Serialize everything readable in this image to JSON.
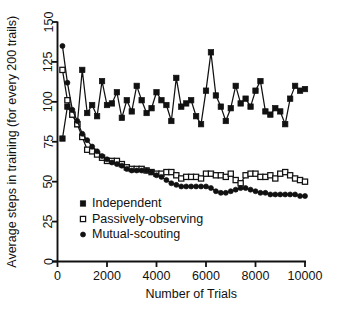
{
  "chart_data": {
    "type": "line",
    "title": "",
    "subtitle": "",
    "xlabel": "Number of Trials",
    "ylabel": "Average steps in training (for every 200 trails)",
    "xlim": [
      0,
      10000
    ],
    "ylim": [
      0,
      150
    ],
    "xticks": [
      0,
      2000,
      4000,
      6000,
      8000,
      10000
    ],
    "xtick_labels": [
      "0",
      "2000",
      "4000",
      "6000",
      "8000",
      "10000"
    ],
    "yticks": [
      0,
      25,
      50,
      75,
      100,
      125,
      150
    ],
    "ytick_labels": [
      "0",
      "25",
      "50",
      "75",
      "100",
      "125",
      "150"
    ],
    "grid": false,
    "legend_position": "inside-lower-left",
    "marker_colors": {
      "line": "#111111",
      "fill": "#111111",
      "open_fill": "#ffffff"
    },
    "x": [
      200,
      400,
      600,
      800,
      1000,
      1200,
      1400,
      1600,
      1800,
      2000,
      2200,
      2400,
      2600,
      2800,
      3000,
      3200,
      3400,
      3600,
      3800,
      4000,
      4200,
      4400,
      4600,
      4800,
      5000,
      5200,
      5400,
      5600,
      5800,
      6000,
      6200,
      6400,
      6600,
      6800,
      7000,
      7200,
      7400,
      7600,
      7800,
      8000,
      8200,
      8400,
      8600,
      8800,
      9000,
      9200,
      9400,
      9600,
      9800,
      10000
    ],
    "series": [
      {
        "name": "Independent",
        "marker": "filled-square",
        "values": [
          77,
          97,
          92,
          86,
          120,
          93,
          98,
          91,
          113,
          98,
          99,
          106,
          90,
          101,
          94,
          110,
          101,
          93,
          96,
          106,
          101,
          98,
          88,
          115,
          97,
          99,
          101,
          91,
          86,
          107,
          131,
          104,
          97,
          88,
          96,
          110,
          99,
          102,
          97,
          107,
          113,
          94,
          92,
          96,
          94,
          86,
          102,
          110,
          107,
          108
        ]
      },
      {
        "name": "Passively-observing",
        "marker": "open-square",
        "values": [
          120,
          101,
          92,
          86,
          78,
          70,
          69,
          67,
          65,
          63,
          63,
          63,
          61,
          59,
          58,
          58,
          58,
          57,
          56,
          55,
          55,
          56,
          56,
          54,
          52,
          53,
          53,
          53,
          52,
          55,
          55,
          54,
          54,
          53,
          55,
          51,
          49,
          54,
          55,
          55,
          53,
          53,
          54,
          52,
          55,
          56,
          54,
          52,
          51,
          50
        ]
      },
      {
        "name": "Mutual-scouting",
        "marker": "filled-circle",
        "values": [
          135,
          112,
          95,
          88,
          80,
          76,
          72,
          69,
          66,
          64,
          62,
          61,
          60,
          58,
          57,
          57,
          57,
          57,
          56,
          54,
          53,
          51,
          49,
          48,
          47,
          47,
          47,
          47,
          47,
          47,
          46,
          44,
          43,
          43,
          44,
          45,
          46,
          46,
          45,
          44,
          43,
          43,
          42,
          42,
          42,
          42,
          42,
          42,
          41,
          41
        ]
      }
    ],
    "legend": [
      {
        "label": "Independent",
        "marker": "filled-square"
      },
      {
        "label": "Passively-observing",
        "marker": "open-square"
      },
      {
        "label": "Mutual-scouting",
        "marker": "filled-circle"
      }
    ]
  }
}
